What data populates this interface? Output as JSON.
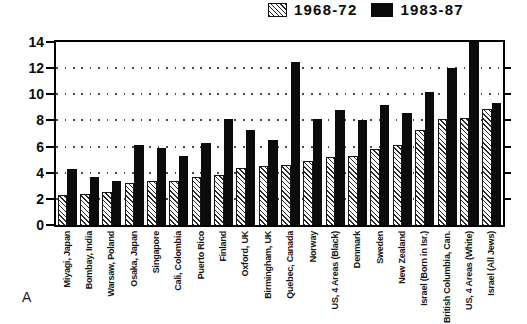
{
  "panel_label": "A",
  "colors": {
    "background": "#ffffff",
    "bar_solid": "#0b0b0b",
    "hatch_line": "#2a2a2a",
    "axis": "#000000",
    "grid_dot": "#4a4a4a"
  },
  "legend": [
    {
      "label": "1968-72",
      "swatch": "hatched"
    },
    {
      "label": "1983-87",
      "swatch": "solid-black"
    }
  ],
  "chart_data": {
    "type": "bar",
    "title": "",
    "xlabel": "",
    "ylabel": "",
    "ylim": [
      0,
      14
    ],
    "yticks": [
      0,
      2,
      4,
      6,
      8,
      10,
      12,
      14
    ],
    "grid": "dotted horizontal lines at even values",
    "legend_position": "top-right",
    "categories": [
      "Miyagi, Japan",
      "Bombay, India",
      "Warsaw, Poland",
      "Osaka, Japan",
      "Singapore",
      "Cali, Colombia",
      "Puerto Rico",
      "Finland",
      "Oxford, UK",
      "Birmingham, UK",
      "Quebec, Canada",
      "Norway",
      "US, 4 Areas (Black)",
      "Denmark",
      "Sweden",
      "New Zealand",
      "Israel (Born in Isr.)",
      "British Columbia, Can.",
      "US, 4 Areas (White)",
      "Israel (All Jews)"
    ],
    "series": [
      {
        "name": "1968-72",
        "style": "hatched",
        "values": [
          2.3,
          2.4,
          2.5,
          3.2,
          3.4,
          3.4,
          3.7,
          3.8,
          4.4,
          4.5,
          4.6,
          4.9,
          5.2,
          5.3,
          5.8,
          6.1,
          7.3,
          8.1,
          8.2,
          8.9
        ]
      },
      {
        "name": "1983-87",
        "style": "solid",
        "values": [
          4.3,
          3.7,
          3.4,
          6.1,
          5.9,
          5.3,
          6.3,
          8.1,
          7.3,
          6.5,
          12.5,
          8.1,
          8.8,
          8.0,
          9.2,
          8.6,
          10.2,
          12.0,
          14.0,
          9.3
        ]
      }
    ]
  }
}
